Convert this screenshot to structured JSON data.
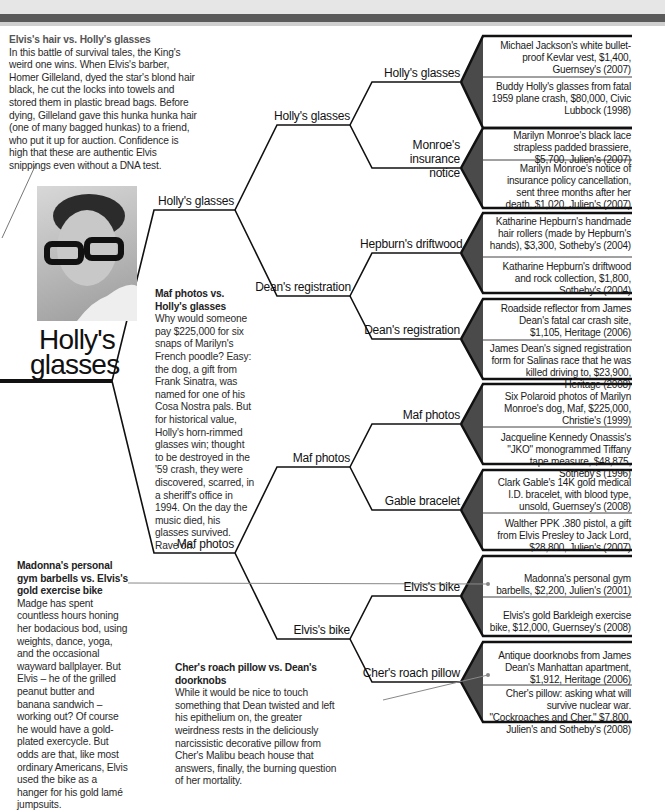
{
  "header": {
    "band_color": "#e6e6e6",
    "bar_color": "#5a5a5a"
  },
  "champion": {
    "label": "Holly's glasses",
    "photo_icon": "buddy-holly-portrait"
  },
  "blurbs": [
    {
      "title": "Elvis's hair vs. Holly's glasses",
      "body": "In this battle of survival tales, the King's weird one wins. When Elvis's barber, Homer Gilleland, dyed the star's blond hair black, he cut the locks into towels and stored them in plastic bread bags. Before dying, Gilleland gave this hunka hunka hair (one of many bagged hunkas) to a friend, who put it up for auction. Confidence is high that these are authentic Elvis snippings even without a DNA test."
    },
    {
      "title": "Maf photos vs. Holly's glasses",
      "body": "Why would someone pay $225,000 for six snaps of Marilyn's French poodle? Easy: the dog, a gift from Frank Sinatra, was named for one of his Cosa Nostra pals. But for historical value, Holly's horn-rimmed glasses win; thought to be destroyed in the '59 crash, they were discovered, scarred, in a sheriff's office in 1994. On the day the music died, his glasses survived. Rave on."
    },
    {
      "title": "Madonna's personal gym barbells vs. Elvis's gold exercise bike",
      "body": "Madge has spent countless hours honing her bodacious bod, using weights, dance, yoga, and the occasional wayward ballplayer. But Elvis – he of the grilled peanut butter and banana sandwich – working out? Of course he would have a gold-plated exercycle. But odds are that, like most ordinary Americans, Elvis used the bike as a hanger for his gold lamé jumpsuits."
    },
    {
      "title": "Cher's roach pillow vs. Dean's doorknobs",
      "body": "While it would be nice to touch something that Dean twisted and left his epithelium on, the greater weirdness rests in the deliciously narcissistic decorative pillow from Cher's Malibu beach house that answers, finally, the burning question of her mortality."
    }
  ],
  "round1": [
    "Holly's glasses",
    "Maf photos"
  ],
  "round2": [
    "Holly's glasses",
    "Dean's registration",
    "Maf photos",
    "Elvis's bike"
  ],
  "round3": [
    "Holly's glasses",
    "Monroe's insurance notice",
    "Hepburn's driftwood",
    "Dean's registration",
    "Maf photos",
    "Gable bracelet",
    "Elvis's bike",
    "Cher's roach pillow"
  ],
  "items": [
    "Michael Jackson's white bullet-proof Kevlar vest, $1,400, Guernsey's (2007)",
    "Buddy Holly's glasses from fatal 1959 plane crash, $80,000, Civic Lubbock (1998)",
    "Marilyn Monroe's black lace strapless padded brassiere, $5,700, Julien's (2007)",
    "Marilyn Monroe's notice of insurance policy cancellation, sent three months after her death, $1,020, Julien's (2007)",
    "Katharine Hepburn's handmade hair rollers (made by Hepburn's hands), $3,300, Sotheby's (2004)",
    "Katharine Hepburn's driftwood and rock collection, $1,800, Sotheby's (2004)",
    "Roadside reflector from James Dean's fatal car crash site, $1,105, Heritage (2006)",
    "James Dean's signed registration form for Salinas race that he was killed driving to, $23,900, Heritage (2008)",
    "Six Polaroid photos of Marilyn Monroe's dog, Maf, $225,000, Christie's (1999)",
    "Jacqueline Kennedy Onassis's \"JKO\" monogrammed Tiffany tape measure, $48,875, Sotheby's (1996)",
    "Clark Gable's 14K gold medical I.D. bracelet, with blood type, unsold, Guernsey's (2008)",
    "Walther PPK .380 pistol, a gift from Elvis Presley to Jack Lord, $28,800, Julien's (2007)",
    "Madonna's personal gym barbells, $2,200, Julien's (2001)",
    "Elvis's gold Barkleigh exercise bike, $12,000, Guernsey's (2008)",
    "Antique doorknobs from James Dean's Manhattan apartment, $1,912, Heritage (2006)",
    "Cher's pillow: asking what will survive nuclear war. \"Cockroaches and Cher,\" $7,800, Julien's and Sotheby's (2008)"
  ],
  "colors": {
    "line": "#111111",
    "bracket_fill": "#4a4a4a",
    "pointer": "#888888"
  }
}
